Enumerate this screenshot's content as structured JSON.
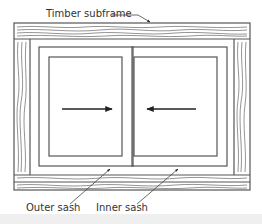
{
  "diagram": {
    "labels": {
      "timber_subframe": "Timber subframe",
      "outer_sash": "Outer sash",
      "inner_sash": "Inner sash"
    },
    "arrows": [
      {
        "name": "slide-right-arrow",
        "direction": "right"
      },
      {
        "name": "slide-left-arrow",
        "direction": "left"
      }
    ],
    "colors": {
      "line": "#555555",
      "text": "#333333",
      "background": "#ffffff"
    }
  }
}
